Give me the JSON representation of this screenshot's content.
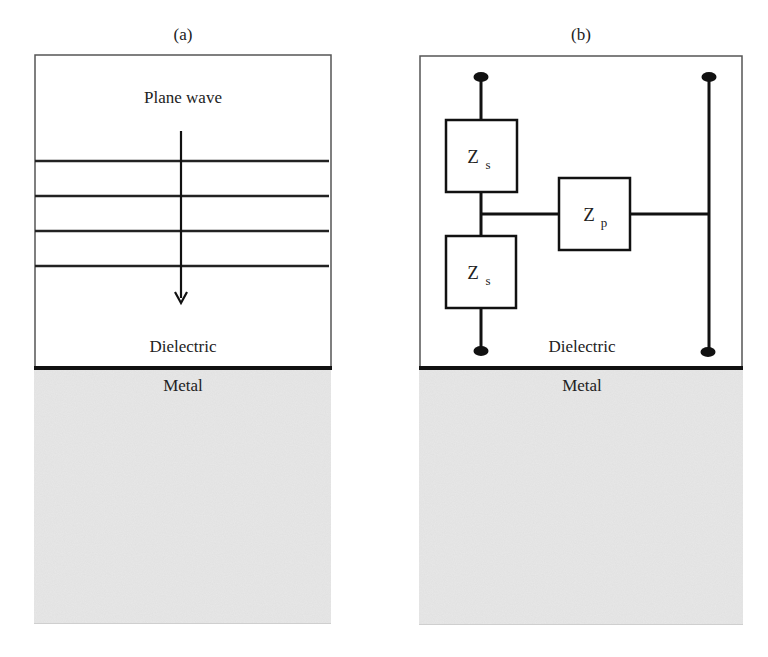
{
  "panels": [
    {
      "id": "a",
      "label": "(a)",
      "wave_label": "Plane wave",
      "dielectric_label": "Dielectric",
      "metal_label": "Metal",
      "wavefront_lines": 4
    },
    {
      "id": "b",
      "label": "(b)",
      "dielectric_label": "Dielectric",
      "metal_label": "Metal",
      "components": [
        {
          "name": "Zs",
          "main": "Z",
          "sub": "s",
          "role": "series impedance (top)"
        },
        {
          "name": "Zs",
          "main": "Z",
          "sub": "s",
          "role": "series impedance (bottom)"
        },
        {
          "name": "Zp",
          "main": "Z",
          "sub": "p",
          "role": "parallel impedance"
        }
      ]
    }
  ],
  "colors": {
    "metal_fill": "#e8e8e8",
    "line": "#111111",
    "dielectric_fill": "#ffffff"
  }
}
